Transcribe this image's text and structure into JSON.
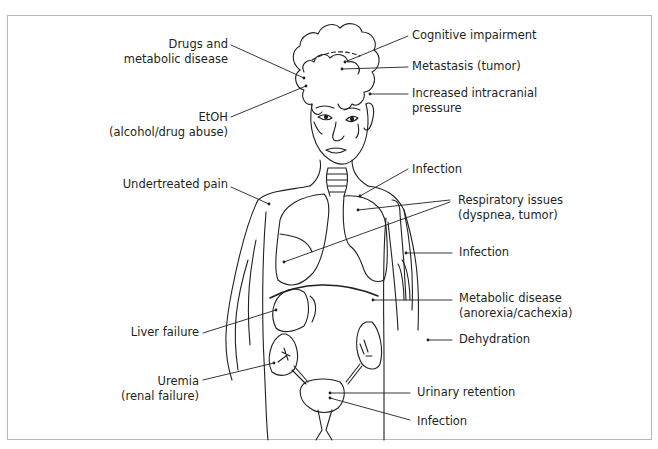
{
  "figure": {
    "line_color": "#231f20",
    "frame_color": "#b8b8b8"
  },
  "labels_left": [
    {
      "id": "drugs",
      "lines": [
        "Drugs and",
        "metabolic disease"
      ]
    },
    {
      "id": "etoh",
      "lines": [
        "EtOH",
        "(alcohol/drug abuse)"
      ]
    },
    {
      "id": "pain",
      "lines": [
        "Undertreated pain"
      ]
    },
    {
      "id": "liver",
      "lines": [
        "Liver failure"
      ]
    },
    {
      "id": "uremia",
      "lines": [
        "Uremia",
        "(renal failure)"
      ]
    }
  ],
  "labels_right": [
    {
      "id": "cognitive",
      "lines": [
        "Cognitive impairment"
      ]
    },
    {
      "id": "metastasis",
      "lines": [
        "Metastasis (tumor)"
      ]
    },
    {
      "id": "icp",
      "lines": [
        "Increased intracranial",
        "pressure"
      ]
    },
    {
      "id": "infection_chest",
      "lines": [
        "Infection"
      ]
    },
    {
      "id": "respiratory",
      "lines": [
        "Respiratory issues",
        "(dyspnea, tumor)"
      ]
    },
    {
      "id": "infection_arm",
      "lines": [
        "Infection"
      ]
    },
    {
      "id": "metabolic",
      "lines": [
        "Metabolic disease",
        "(anorexia/cachexia)"
      ]
    },
    {
      "id": "dehydration",
      "lines": [
        "Dehydration"
      ]
    },
    {
      "id": "urinary",
      "lines": [
        "Urinary retention"
      ]
    },
    {
      "id": "infection_bladder",
      "lines": [
        "Infection"
      ]
    }
  ]
}
